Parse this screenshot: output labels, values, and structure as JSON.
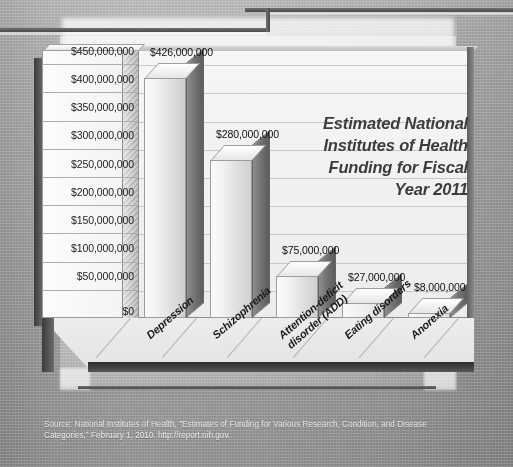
{
  "chart_data": {
    "type": "bar",
    "title_lines": [
      "Estimated National",
      "Institutes of Health",
      "Funding for Fiscal",
      "Year 2011"
    ],
    "xlabel": "",
    "ylabel": "",
    "ylim": [
      0,
      475000000
    ],
    "grid": true,
    "legend": "none",
    "categories": [
      "Depression",
      "Schizophrenia",
      "Attention-deficit disorder (ADD)",
      "Eating disorders",
      "Anorexia"
    ],
    "category_lines": [
      [
        "Depression"
      ],
      [
        "Schizophrenia"
      ],
      [
        "Attention-deficit",
        "disorder (ADD)"
      ],
      [
        "Eating disorders"
      ],
      [
        "Anorexia"
      ]
    ],
    "values": [
      426000000,
      280000000,
      75000000,
      27000000,
      8000000
    ],
    "value_labels": [
      "$426,000,000",
      "$280,000,000",
      "$75,000,000",
      "$27,000,000",
      "$8,000,000"
    ],
    "y_ticks": [
      "$450,000,000",
      "$400,000,000",
      "$350,000,000",
      "$300,000,000",
      "$250,000,000",
      "$200,000,000",
      "$150,000,000",
      "$100,000,000",
      "$50,000,000",
      "$0"
    ],
    "y_tick_values": [
      450000000,
      400000000,
      350000000,
      300000000,
      250000000,
      200000000,
      150000000,
      100000000,
      50000000,
      0
    ]
  },
  "source": {
    "line1": "Source: National Institutes of Health, \"Estimates of Funding for Various Research, Condition, and Disease",
    "line2": "Categories,\" February 1, 2010. http://report.nih.gov."
  },
  "colors": {
    "bar_face": "#f0f0f0",
    "bar_side": "#6f6f6f",
    "plot_bg": "#f2f2f2",
    "grid": "#c7c7c7",
    "title_text": "#3c3c3c",
    "source_text": "#e9e9e9",
    "page_bg": "#b2b2b2"
  }
}
